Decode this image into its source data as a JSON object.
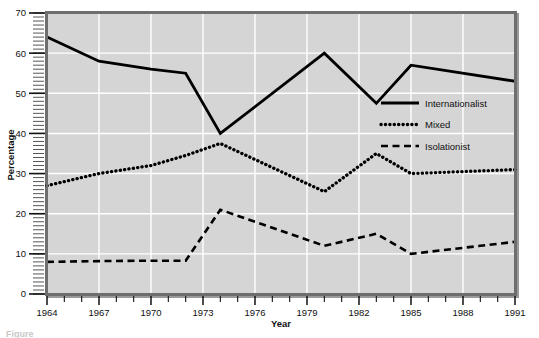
{
  "chart_data": {
    "type": "line",
    "title": "",
    "xlabel": "Year",
    "ylabel": "Percentage",
    "xlim": [
      1964,
      1991
    ],
    "ylim": [
      0,
      70
    ],
    "grid": true,
    "legend_position": "inside-right",
    "y_ticks": [
      0,
      10,
      20,
      30,
      40,
      50,
      60,
      70
    ],
    "y_tick_labels": [
      "0",
      "10",
      "20",
      "30",
      "40",
      "50",
      "60",
      "70"
    ],
    "x_ticks": [
      1964,
      1965,
      1966,
      1967,
      1968,
      1969,
      1970,
      1971,
      1972,
      1973,
      1974,
      1975,
      1976,
      1977,
      1978,
      1979,
      1980,
      1981,
      1982,
      1983,
      1984,
      1985,
      1986,
      1987,
      1988,
      1989,
      1990,
      1991
    ],
    "x_tick_labels": [
      "1964",
      "1967",
      "1970",
      "1973",
      "1976",
      "1979",
      "1982",
      "1985",
      "1988",
      "1991"
    ],
    "x_label_years": [
      1964,
      1967,
      1970,
      1973,
      1976,
      1979,
      1982,
      1985,
      1988,
      1991
    ],
    "x_gridline_years": [
      1967,
      1970,
      1973,
      1976,
      1979,
      1982,
      1985,
      1988
    ],
    "series": [
      {
        "name": "Internationalist",
        "style": "solid",
        "color": "#000000",
        "x": [
          1964,
          1967,
          1970,
          1972,
          1974,
          1980,
          1983,
          1985,
          1991
        ],
        "values": [
          64,
          58,
          56,
          55,
          40,
          60,
          47.5,
          57,
          53
        ]
      },
      {
        "name": "Mixed",
        "style": "dotted",
        "color": "#000000",
        "x": [
          1964,
          1967,
          1970,
          1972,
          1974,
          1980,
          1983,
          1985,
          1991
        ],
        "values": [
          27,
          30,
          32,
          34.5,
          37.5,
          25.5,
          35,
          30,
          31
        ]
      },
      {
        "name": "Isolationist",
        "style": "dashed",
        "color": "#000000",
        "x": [
          1964,
          1967,
          1970,
          1972,
          1974,
          1980,
          1983,
          1985,
          1991
        ],
        "values": [
          8,
          8.2,
          8.3,
          8.3,
          21,
          12,
          15,
          10,
          13
        ]
      }
    ]
  },
  "legend": {
    "entries": [
      {
        "label": "Internationalist",
        "style": "solid"
      },
      {
        "label": "Mixed",
        "style": "dotted"
      },
      {
        "label": "Isolationist",
        "style": "dashed"
      }
    ]
  },
  "caption": {
    "text": "Figure"
  },
  "colors": {
    "plot_background": "#d5d5d5",
    "gridline": "#ffffff",
    "frame": "#6e6e6e",
    "frame_shadow": "#9a9a9a",
    "series": "#000000",
    "text": "#111111"
  }
}
